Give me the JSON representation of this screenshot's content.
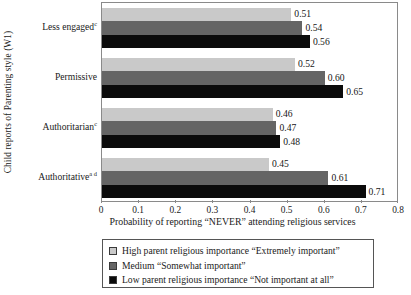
{
  "chart_data": {
    "type": "bar",
    "orientation": "horizontal",
    "title": "",
    "xlabel": "Probability of reporting “NEVER” attending religious services",
    "ylabel": "Child reports of Parenting style (W1)",
    "xlim": [
      0,
      0.8
    ],
    "xticks": [
      0,
      0.1,
      0.2,
      0.3,
      0.4,
      0.5,
      0.6,
      0.7,
      0.8
    ],
    "xticklabels": [
      "0",
      "0.1",
      "0.2",
      "0.3",
      "0.4",
      "0.5",
      "0.6",
      "0.7",
      "0.8"
    ],
    "grid": false,
    "legend_position": "below-axis",
    "categories": [
      "Less engaged",
      "Permissive",
      "Authoritarian",
      "Authoritative"
    ],
    "category_superscripts": [
      "c",
      "",
      "c",
      "a d"
    ],
    "series": [
      {
        "name": "High parent religious importance “Extremely important”",
        "color": "#c9c9c9",
        "values": [
          0.51,
          0.52,
          0.46,
          0.45
        ],
        "labels": [
          "0.51",
          "0.52",
          "0.46",
          "0.45"
        ]
      },
      {
        "name": "Medium “Somewhat important”",
        "color": "#656565",
        "values": [
          0.54,
          0.6,
          0.47,
          0.61
        ],
        "labels": [
          "0.54",
          "0.60",
          "0.47",
          "0.61"
        ]
      },
      {
        "name": "Low parent religious importance “Not important at all”",
        "color": "#0b0b0b",
        "values": [
          0.56,
          0.65,
          0.48,
          0.71
        ],
        "labels": [
          "0.56",
          "0.65",
          "0.48",
          "0.71"
        ]
      }
    ]
  }
}
